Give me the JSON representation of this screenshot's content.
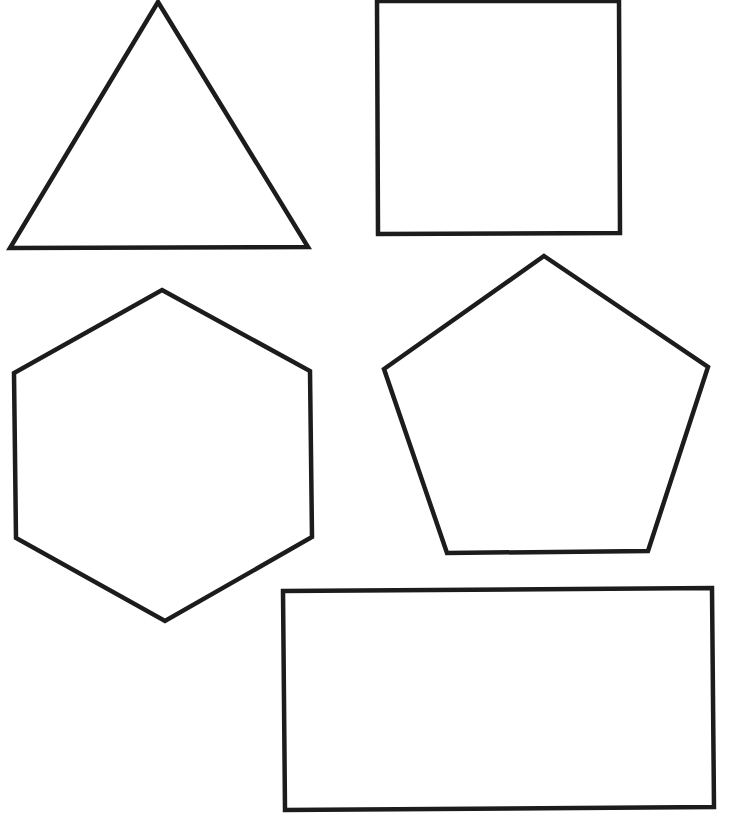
{
  "canvas": {
    "width": 729,
    "height": 813,
    "background": "#ffffff",
    "stroke_color": "#1c1c1c",
    "stroke_width": 4.5
  },
  "shapes": [
    {
      "name": "triangle",
      "sides": 3,
      "fill": "none",
      "points": "158,2 308,247 10,248"
    },
    {
      "name": "square",
      "sides": 4,
      "fill": "none",
      "points": "377,1 619,1 620,233 378,234"
    },
    {
      "name": "hexagon",
      "sides": 6,
      "fill": "none",
      "points": "162,290 310,371 312,537 165,621 16,538 14,373"
    },
    {
      "name": "pentagon",
      "sides": 5,
      "fill": "none",
      "points": "544,256 708,367 648,551 447,553 384,369"
    },
    {
      "name": "rectangle",
      "sides": 4,
      "fill": "none",
      "points": "283,591 712,588 714,807 285,810"
    }
  ]
}
